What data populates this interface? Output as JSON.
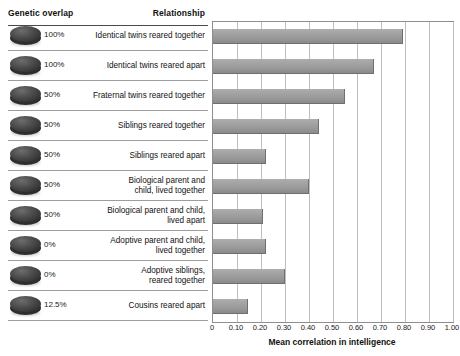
{
  "headers": {
    "genetic_overlap": "Genetic overlap",
    "relationship": "Relationship"
  },
  "chart_data": {
    "type": "bar",
    "orientation": "horizontal",
    "title": "",
    "xlabel": "Mean correlation in intelligence",
    "ylabel": "",
    "xlim": [
      0,
      1.0
    ],
    "grid": true,
    "legend": "none",
    "tick_labels": [
      "0",
      "0.10",
      "0.20",
      "0.30",
      "0.40",
      "0.50",
      "0.60",
      "0.70",
      "0.80",
      "0.90",
      "1.00"
    ],
    "tick_values": [
      0,
      0.1,
      0.2,
      0.3,
      0.4,
      0.5,
      0.6,
      0.7,
      0.8,
      0.9,
      1.0
    ],
    "categories": [
      "Identical twins reared together",
      "Identical twins reared apart",
      "Fraternal twins reared together",
      "Siblings reared together",
      "Siblings reared apart",
      "Biological parent and child, lived together",
      "Biological parent and child, lived apart",
      "Adoptive parent and child, lived together",
      "Adoptive siblings, reared together",
      "Cousins reared apart"
    ],
    "values": [
      0.79,
      0.67,
      0.55,
      0.44,
      0.22,
      0.4,
      0.21,
      0.22,
      0.3,
      0.145
    ],
    "genetic_overlap": [
      "100%",
      "100%",
      "50%",
      "50%",
      "50%",
      "50%",
      "50%",
      "0%",
      "0%",
      "12.5%"
    ],
    "bar_color": "#9a9a9a",
    "grid_color": "#bfbfbf"
  },
  "rows": [
    {
      "pct": "100%",
      "relationship": "Identical twins reared together",
      "value": 0.79
    },
    {
      "pct": "100%",
      "relationship": "Identical twins reared apart",
      "value": 0.67
    },
    {
      "pct": "50%",
      "relationship": "Fraternal twins reared together",
      "value": 0.55
    },
    {
      "pct": "50%",
      "relationship": "Siblings reared together",
      "value": 0.44
    },
    {
      "pct": "50%",
      "relationship": "Siblings reared apart",
      "value": 0.22
    },
    {
      "pct": "50%",
      "relationship": "Biological parent and\nchild, lived together",
      "value": 0.4
    },
    {
      "pct": "50%",
      "relationship": "Biological parent and child,\nlived apart",
      "value": 0.21
    },
    {
      "pct": "0%",
      "relationship": "Adoptive parent and child,\nlived together",
      "value": 0.22
    },
    {
      "pct": "0%",
      "relationship": "Adoptive siblings,\nreared together",
      "value": 0.3
    },
    {
      "pct": "12.5%",
      "relationship": "Cousins reared apart",
      "value": 0.145
    }
  ],
  "axis": {
    "label": "Mean correlation in intelligence"
  },
  "icons": {
    "disc": "genetic-overlap-disc"
  }
}
